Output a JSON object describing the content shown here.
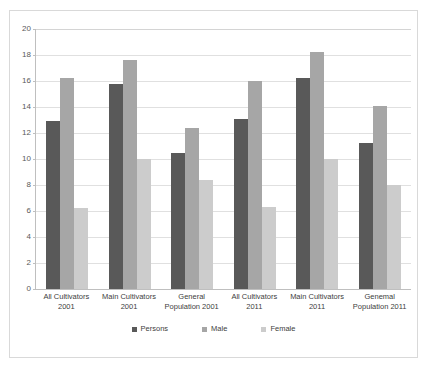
{
  "chart_data": {
    "type": "bar",
    "title": "",
    "subtitle": "",
    "xlabel": "",
    "ylabel": "",
    "ylim": [
      0,
      20
    ],
    "ytick_step": 2,
    "yticks": [
      "20",
      "18",
      "16",
      "14",
      "12",
      "10",
      "8",
      "6",
      "4",
      "2",
      "0"
    ],
    "grid": true,
    "legend_position": "bottom",
    "categories": [
      "All Cultivators 2001",
      "Main Cultivators 2001",
      "General Population 2001",
      "All Cultivators 2011",
      "Main Cultivators 2011",
      "Genemal Population 2011"
    ],
    "category_lines": [
      [
        "All Cultivators",
        "2001"
      ],
      [
        "Main Cultivators",
        "2001"
      ],
      [
        "General",
        "Population 2001"
      ],
      [
        "All Cultivators",
        "2011"
      ],
      [
        "Main Cultivators",
        "2011"
      ],
      [
        "Genemal",
        "Population 2011"
      ]
    ],
    "series": [
      {
        "name": "Persons",
        "color": "#595959",
        "values": [
          12.9,
          15.8,
          10.5,
          13.1,
          16.2,
          11.2
        ]
      },
      {
        "name": "Male",
        "color": "#a6a6a6",
        "values": [
          16.2,
          17.6,
          12.4,
          16.0,
          18.2,
          14.1
        ]
      },
      {
        "name": "Female",
        "color": "#cccccc",
        "values": [
          6.2,
          10.0,
          8.4,
          6.3,
          10.0,
          8.0
        ]
      }
    ]
  },
  "legend": {
    "items": [
      {
        "label": "Persons",
        "swatch": "legend-swatch-persons"
      },
      {
        "label": "Male",
        "swatch": "legend-swatch-male"
      },
      {
        "label": "Female",
        "swatch": "legend-swatch-female"
      }
    ]
  },
  "colors": {
    "persons": "#595959",
    "male": "#a6a6a6",
    "female": "#cccccc",
    "gridline": "#e0e0e0",
    "axis": "#bfbfbf",
    "frame_border": "#d9d9d9",
    "background": "#ffffff",
    "text": "#404040"
  }
}
